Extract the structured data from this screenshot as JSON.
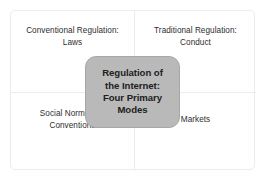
{
  "diagram": {
    "title": "Regulation of the Internet: Four Primary Modes",
    "type": "2x2-matrix",
    "center": {
      "label": "Regulation of the Internet: Four Primary Modes",
      "lines": [
        "Regulation of",
        "the Internet:",
        "Four Primary",
        "Modes"
      ],
      "fill_color": "#b9b9b9",
      "border_color": "#a6a6a6",
      "text_color": "#202020"
    },
    "frame": {
      "border_color": "#ececed",
      "divider_color": "#ececed",
      "background_color": "#ffffff"
    },
    "quadrants": [
      {
        "position": "top-left",
        "label": "Conventional Regulation: Laws",
        "lines": [
          "Conventional Regulation:",
          "Laws"
        ],
        "text_color": "#2e2e2e"
      },
      {
        "position": "top-right",
        "label": "Traditional Regulation: Conduct",
        "lines": [
          "Traditional Regulation:",
          "Conduct"
        ],
        "text_color": "#2e2e2e"
      },
      {
        "position": "bottom-left",
        "label": "Social Norms and Conventions",
        "lines": [
          "Social Norms and",
          "Conventions"
        ],
        "text_color": "#2e2e2e"
      },
      {
        "position": "bottom-right",
        "label": "Markets",
        "lines": [
          "Markets"
        ],
        "text_color": "#2e2e2e"
      }
    ]
  }
}
